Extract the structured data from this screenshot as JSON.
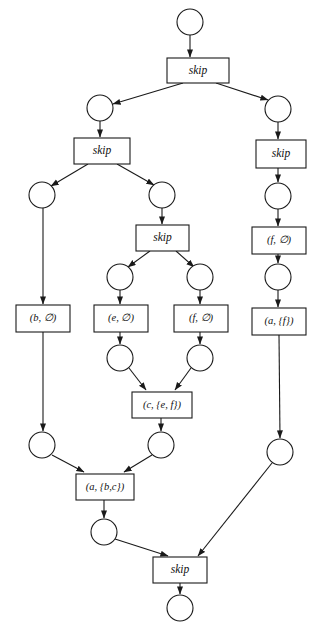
{
  "diagram": {
    "type": "petri-net",
    "width": 319,
    "height": 639,
    "colors": {
      "background": "#ffffff",
      "stroke": "#1a1a1a",
      "node_fill": "#ffffff",
      "text": "#111111"
    },
    "places": [
      {
        "id": "p0",
        "label": "",
        "cx": 190,
        "cy": 22,
        "r": 13
      },
      {
        "id": "p1",
        "label": "",
        "cx": 100,
        "cy": 108,
        "r": 13
      },
      {
        "id": "p2",
        "label": "",
        "cx": 278,
        "cy": 109,
        "r": 13
      },
      {
        "id": "p3",
        "label": "",
        "cx": 42,
        "cy": 195,
        "r": 13
      },
      {
        "id": "p4",
        "label": "",
        "cx": 162,
        "cy": 195,
        "r": 13
      },
      {
        "id": "p5",
        "label": "",
        "cx": 278,
        "cy": 196,
        "r": 13
      },
      {
        "id": "p6",
        "label": "",
        "cx": 120,
        "cy": 277,
        "r": 13
      },
      {
        "id": "p7",
        "label": "",
        "cx": 200,
        "cy": 277,
        "r": 13
      },
      {
        "id": "p8",
        "label": "",
        "cx": 278,
        "cy": 277,
        "r": 13
      },
      {
        "id": "p9",
        "label": "",
        "cx": 120,
        "cy": 358,
        "r": 13
      },
      {
        "id": "p10",
        "label": "",
        "cx": 200,
        "cy": 358,
        "r": 13
      },
      {
        "id": "p11",
        "label": "",
        "cx": 42,
        "cy": 445,
        "r": 13
      },
      {
        "id": "p12",
        "label": "",
        "cx": 161,
        "cy": 445,
        "r": 13
      },
      {
        "id": "p13",
        "label": "",
        "cx": 280,
        "cy": 452,
        "r": 13
      },
      {
        "id": "p14",
        "label": "",
        "cx": 104,
        "cy": 532,
        "r": 13
      },
      {
        "id": "p15",
        "label": "",
        "cx": 180,
        "cy": 608,
        "r": 13
      }
    ],
    "transitions": [
      {
        "id": "t_skip_top",
        "label": "skip",
        "kind": "skip",
        "x": 167,
        "y": 58,
        "w": 62,
        "h": 25
      },
      {
        "id": "t_skip_left",
        "label": "skip",
        "kind": "skip",
        "x": 74,
        "y": 138,
        "w": 56,
        "h": 26
      },
      {
        "id": "t_skip_right",
        "label": "skip",
        "kind": "skip",
        "x": 256,
        "y": 140,
        "w": 50,
        "h": 28
      },
      {
        "id": "t_skip_mid",
        "label": "skip",
        "kind": "skip",
        "x": 136,
        "y": 225,
        "w": 53,
        "h": 26
      },
      {
        "id": "t_b",
        "label": "(b, ∅)",
        "kind": "act",
        "x": 16,
        "y": 305,
        "w": 54,
        "h": 27
      },
      {
        "id": "t_e",
        "label": "(e, ∅)",
        "kind": "act",
        "x": 94,
        "y": 305,
        "w": 54,
        "h": 27
      },
      {
        "id": "t_f_mid",
        "label": "(f, ∅)",
        "kind": "act",
        "x": 174,
        "y": 305,
        "w": 54,
        "h": 27
      },
      {
        "id": "t_f_right",
        "label": "(f, ∅)",
        "kind": "act",
        "x": 252,
        "y": 227,
        "w": 54,
        "h": 27
      },
      {
        "id": "t_a_f",
        "label": "(a, {f})",
        "kind": "act",
        "x": 252,
        "y": 308,
        "w": 54,
        "h": 27
      },
      {
        "id": "t_c_ef",
        "label": "(c, {e, f})",
        "kind": "act",
        "x": 132,
        "y": 392,
        "w": 60,
        "h": 26
      },
      {
        "id": "t_a_bc",
        "label": "(a, {b,c})",
        "kind": "act",
        "x": 76,
        "y": 474,
        "w": 58,
        "h": 26
      },
      {
        "id": "t_skip_bottom",
        "label": "skip",
        "kind": "skip",
        "x": 153,
        "y": 557,
        "w": 54,
        "h": 26
      }
    ],
    "arcs": [
      {
        "from": "p0",
        "to": "t_skip_top",
        "x1": 190,
        "y1": 35,
        "x2": 190,
        "y2": 57
      },
      {
        "from": "t_skip_top",
        "to": "p1",
        "x1": 183,
        "y1": 83,
        "x2": 113,
        "y2": 104
      },
      {
        "from": "t_skip_top",
        "to": "p2",
        "x1": 216,
        "y1": 83,
        "x2": 268,
        "y2": 100
      },
      {
        "from": "p1",
        "to": "t_skip_left",
        "x1": 100,
        "y1": 121,
        "x2": 100,
        "y2": 137
      },
      {
        "from": "p2",
        "to": "t_skip_right",
        "x1": 278,
        "y1": 122,
        "x2": 278,
        "y2": 139
      },
      {
        "from": "t_skip_left",
        "to": "p3",
        "x1": 88,
        "y1": 164,
        "x2": 51,
        "y2": 186
      },
      {
        "from": "t_skip_left",
        "to": "p4",
        "x1": 117,
        "y1": 164,
        "x2": 154,
        "y2": 185
      },
      {
        "from": "t_skip_right",
        "to": "p5",
        "x1": 278,
        "y1": 168,
        "x2": 278,
        "y2": 182
      },
      {
        "from": "p4",
        "to": "t_skip_mid",
        "x1": 162,
        "y1": 208,
        "x2": 162,
        "y2": 224
      },
      {
        "from": "p5",
        "to": "t_f_right",
        "x1": 278,
        "y1": 209,
        "x2": 278,
        "y2": 226
      },
      {
        "from": "t_skip_mid",
        "to": "p6",
        "x1": 150,
        "y1": 251,
        "x2": 128,
        "y2": 267
      },
      {
        "from": "t_skip_mid",
        "to": "p7",
        "x1": 176,
        "y1": 251,
        "x2": 194,
        "y2": 267
      },
      {
        "from": "t_f_right",
        "to": "p8",
        "x1": 278,
        "y1": 254,
        "x2": 278,
        "y2": 263
      },
      {
        "from": "p3",
        "to": "t_b",
        "x1": 43,
        "y1": 208,
        "x2": 43,
        "y2": 304
      },
      {
        "from": "p6",
        "to": "t_e",
        "x1": 120,
        "y1": 290,
        "x2": 120,
        "y2": 304
      },
      {
        "from": "p7",
        "to": "t_f_mid",
        "x1": 200,
        "y1": 290,
        "x2": 200,
        "y2": 304
      },
      {
        "from": "p8",
        "to": "t_a_f",
        "x1": 278,
        "y1": 290,
        "x2": 278,
        "y2": 307
      },
      {
        "from": "t_e",
        "to": "p9",
        "x1": 120,
        "y1": 332,
        "x2": 120,
        "y2": 344
      },
      {
        "from": "t_f_mid",
        "to": "p10",
        "x1": 200,
        "y1": 332,
        "x2": 200,
        "y2": 344
      },
      {
        "from": "p9",
        "to": "t_c_ef",
        "x1": 129,
        "y1": 368,
        "x2": 146,
        "y2": 390
      },
      {
        "from": "p10",
        "to": "t_c_ef",
        "x1": 191,
        "y1": 368,
        "x2": 175,
        "y2": 390
      },
      {
        "from": "t_b",
        "to": "p11",
        "x1": 43,
        "y1": 332,
        "x2": 43,
        "y2": 431
      },
      {
        "from": "t_c_ef",
        "to": "p12",
        "x1": 161,
        "y1": 418,
        "x2": 161,
        "y2": 431
      },
      {
        "from": "t_a_f",
        "to": "p13",
        "x1": 279,
        "y1": 335,
        "x2": 280,
        "y2": 438
      },
      {
        "from": "p11",
        "to": "t_a_bc",
        "x1": 52,
        "y1": 455,
        "x2": 84,
        "y2": 472
      },
      {
        "from": "p12",
        "to": "t_a_bc",
        "x1": 152,
        "y1": 455,
        "x2": 124,
        "y2": 472
      },
      {
        "from": "t_a_bc",
        "to": "p14",
        "x1": 104,
        "y1": 500,
        "x2": 104,
        "y2": 518
      },
      {
        "from": "p14",
        "to": "t_skip_bottom",
        "x1": 115,
        "y1": 539,
        "x2": 168,
        "y2": 556
      },
      {
        "from": "p13",
        "to": "t_skip_bottom",
        "x1": 272,
        "y1": 463,
        "x2": 198,
        "y2": 556
      },
      {
        "from": "t_skip_bottom",
        "to": "p15",
        "x1": 180,
        "y1": 583,
        "x2": 180,
        "y2": 594
      }
    ]
  }
}
